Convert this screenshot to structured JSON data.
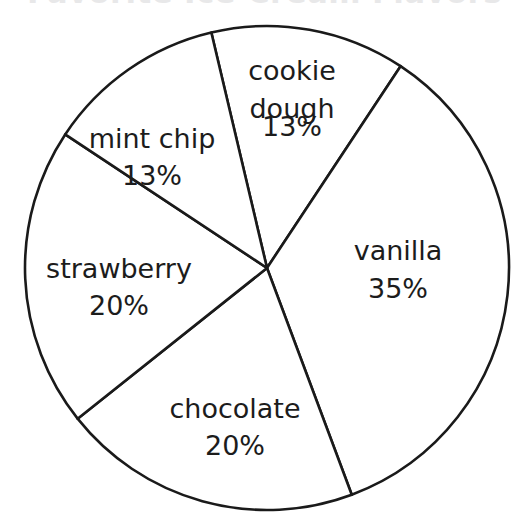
{
  "chart_data": {
    "type": "pie",
    "title": "Favorite Ice Cream Flavors",
    "title_visible": false,
    "categories": [
      "cookie dough",
      "vanilla",
      "chocolate",
      "strawberry",
      "mint chip"
    ],
    "values": [
      13,
      35,
      20,
      20,
      13
    ],
    "value_labels": [
      "13%",
      "35%",
      "20%",
      "20%",
      "13%"
    ],
    "unit": "%",
    "total": 101,
    "start_angle_deg": -13.3,
    "direction": "clockwise",
    "legend": "none",
    "legend_position": "none",
    "grid": false,
    "xlabel": "",
    "ylabel": "",
    "slices": [
      {
        "label": "cookie dough",
        "label_line1": "cookie",
        "label_line2": "dough",
        "value": 13,
        "value_label": "13%",
        "sweep_deg": 46.8,
        "start_deg": -13.3,
        "end_deg": 33.5,
        "label_x": 292,
        "label_y": 72,
        "value_x": 292,
        "value_y": 128,
        "two_line": true
      },
      {
        "label": "vanilla",
        "label_line1": "vanilla",
        "label_line2": "",
        "value": 35,
        "value_label": "35%",
        "sweep_deg": 126.0,
        "start_deg": 33.5,
        "end_deg": 159.5,
        "label_x": 398,
        "label_y": 252,
        "value_x": 398,
        "value_y": 290,
        "two_line": false
      },
      {
        "label": "chocolate",
        "label_line1": "chocolate",
        "label_line2": "",
        "value": 20,
        "value_label": "20%",
        "sweep_deg": 72.0,
        "start_deg": 159.5,
        "end_deg": 231.5,
        "label_x": 235,
        "label_y": 410,
        "value_x": 235,
        "value_y": 447,
        "two_line": false
      },
      {
        "label": "strawberry",
        "label_line1": "strawberry",
        "label_line2": "",
        "value": 20,
        "value_label": "20%",
        "sweep_deg": 72.0,
        "start_deg": 231.5,
        "end_deg": 303.5,
        "label_x": 119,
        "label_y": 270,
        "value_x": 119,
        "value_y": 307,
        "two_line": false
      },
      {
        "label": "mint chip",
        "label_line1": "mint chip",
        "label_line2": "",
        "value": 13,
        "value_label": "13%",
        "sweep_deg": 46.8,
        "start_deg": 303.5,
        "end_deg": 346.7,
        "label_x": 152,
        "label_y": 140,
        "value_x": 152,
        "value_y": 177,
        "two_line": false
      }
    ],
    "geometry": {
      "center_x": 267,
      "center_y": 268,
      "radius": 242
    },
    "style": {
      "background": "#ffffff",
      "stroke": "#1a1a1a",
      "slice_fill": "#ffffff",
      "text_color": "#1c1c1c",
      "stroke_width": 2.6
    }
  }
}
